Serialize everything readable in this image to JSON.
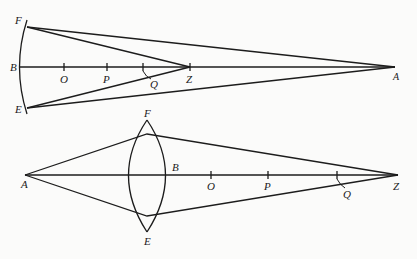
{
  "figures": [
    {
      "name": "concave-mirror-figure",
      "labels": {
        "F": "F",
        "B": "B",
        "E": "E",
        "O": "O",
        "P": "P",
        "Q": "Q",
        "Z": "Z",
        "A": "A"
      }
    },
    {
      "name": "biconvex-lens-figure",
      "labels": {
        "F": "F",
        "E": "E",
        "A": "A",
        "B": "B",
        "O": "O",
        "P": "P",
        "Q": "Q",
        "Z": "Z"
      }
    }
  ],
  "colors": {
    "ink": "#1c1c1c",
    "paper": "#fbfbfa"
  }
}
